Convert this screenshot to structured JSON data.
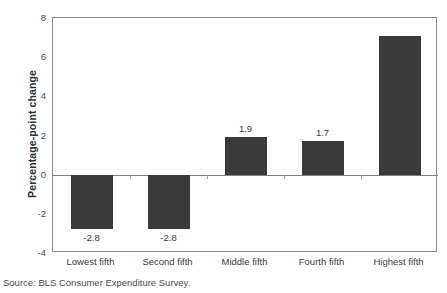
{
  "figure": {
    "title_remnant": "",
    "source_note": "Source: BLS Consumer Expenditure Survey."
  },
  "chart_data": {
    "type": "bar",
    "title": "",
    "xlabel": "",
    "ylabel": "Percentage-point change",
    "categories": [
      "Lowest fifth",
      "Second fifth",
      "Middle fifth",
      "Fourth fifth",
      "Highest fifth"
    ],
    "values": [
      -2.8,
      -2.8,
      1.9,
      1.7,
      7.1
    ],
    "data_labels": [
      "-2.8",
      "-2.8",
      "1.9",
      "1.7",
      ""
    ],
    "ylim": [
      -4,
      8
    ],
    "yticks": [
      8,
      6,
      4,
      2,
      0,
      -2,
      -4
    ],
    "ytick_labels": [
      "8",
      "6",
      "4",
      "2",
      "0",
      "-2",
      "-4"
    ],
    "grid": false,
    "legend": false,
    "bar_color": "#3a3a3a",
    "axis_color": "#8d8d8d",
    "zero_line": 0
  }
}
